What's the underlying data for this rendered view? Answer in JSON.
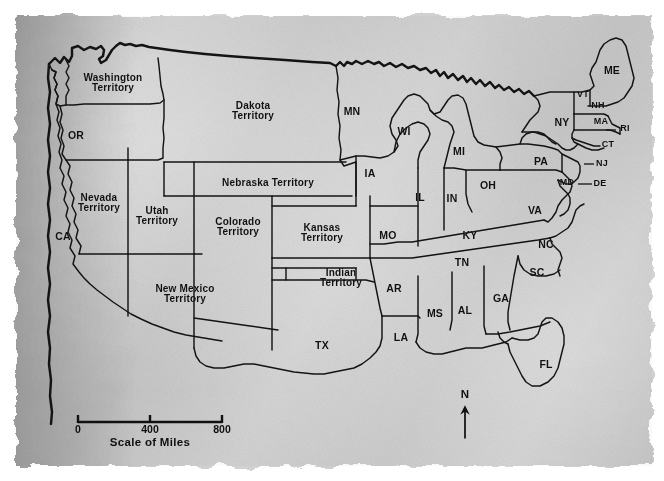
{
  "map": {
    "title": "United States historical map",
    "paper_color": "#c8c8c8",
    "ink_color": "#141414",
    "regions": [
      {
        "name": "washington-territory",
        "label": "Washington\nTerritory",
        "x": 113,
        "y": 83,
        "size": "terr"
      },
      {
        "name": "oregon",
        "label": "OR",
        "x": 76,
        "y": 135,
        "size": "abbr"
      },
      {
        "name": "california",
        "label": "CA",
        "x": 63,
        "y": 236,
        "size": "abbr"
      },
      {
        "name": "nevada-territory",
        "label": "Nevada\nTerritory",
        "x": 99,
        "y": 203,
        "size": "terr"
      },
      {
        "name": "utah-territory",
        "label": "Utah\nTerritory",
        "x": 157,
        "y": 216,
        "size": "terr"
      },
      {
        "name": "colorado-territory",
        "label": "Colorado\nTerritory",
        "x": 238,
        "y": 227,
        "size": "terr"
      },
      {
        "name": "dakota-territory",
        "label": "Dakota\nTerritory",
        "x": 253,
        "y": 111,
        "size": "terr"
      },
      {
        "name": "nebraska-territory",
        "label": "Nebraska Territory",
        "x": 268,
        "y": 183,
        "size": "terr1"
      },
      {
        "name": "kansas-territory",
        "label": "Kansas\nTerritory",
        "x": 322,
        "y": 233,
        "size": "terr"
      },
      {
        "name": "new-mexico-territory",
        "label": "New Mexico\nTerritory",
        "x": 185,
        "y": 294,
        "size": "terr"
      },
      {
        "name": "indian-territory",
        "label": "Indian\nTerritory",
        "x": 341,
        "y": 278,
        "size": "terr"
      },
      {
        "name": "texas",
        "label": "TX",
        "x": 322,
        "y": 345,
        "size": "abbr"
      },
      {
        "name": "minnesota",
        "label": "MN",
        "x": 352,
        "y": 111,
        "size": "abbr"
      },
      {
        "name": "wisconsin",
        "label": "WI",
        "x": 404,
        "y": 131,
        "size": "abbr"
      },
      {
        "name": "iowa",
        "label": "IA",
        "x": 370,
        "y": 173,
        "size": "abbr"
      },
      {
        "name": "missouri",
        "label": "MO",
        "x": 388,
        "y": 235,
        "size": "abbr"
      },
      {
        "name": "arkansas",
        "label": "AR",
        "x": 394,
        "y": 288,
        "size": "abbr"
      },
      {
        "name": "louisiana",
        "label": "LA",
        "x": 401,
        "y": 337,
        "size": "abbr"
      },
      {
        "name": "mississippi",
        "label": "MS",
        "x": 435,
        "y": 313,
        "size": "abbr"
      },
      {
        "name": "alabama",
        "label": "AL",
        "x": 465,
        "y": 310,
        "size": "abbr"
      },
      {
        "name": "georgia",
        "label": "GA",
        "x": 501,
        "y": 298,
        "size": "abbr"
      },
      {
        "name": "florida",
        "label": "FL",
        "x": 546,
        "y": 364,
        "size": "abbr"
      },
      {
        "name": "tennessee",
        "label": "TN",
        "x": 462,
        "y": 262,
        "size": "abbr"
      },
      {
        "name": "kentucky",
        "label": "KY",
        "x": 470,
        "y": 235,
        "size": "abbr"
      },
      {
        "name": "illinois",
        "label": "IL",
        "x": 420,
        "y": 197,
        "size": "abbr"
      },
      {
        "name": "indiana",
        "label": "IN",
        "x": 452,
        "y": 198,
        "size": "abbr"
      },
      {
        "name": "ohio",
        "label": "OH",
        "x": 488,
        "y": 185,
        "size": "abbr"
      },
      {
        "name": "michigan",
        "label": "MI",
        "x": 459,
        "y": 151,
        "size": "abbr"
      },
      {
        "name": "south-carolina",
        "label": "SC",
        "x": 537,
        "y": 272,
        "size": "abbr"
      },
      {
        "name": "north-carolina",
        "label": "NC",
        "x": 546,
        "y": 244,
        "size": "abbr"
      },
      {
        "name": "virginia",
        "label": "VA",
        "x": 535,
        "y": 210,
        "size": "abbr"
      },
      {
        "name": "pennsylvania",
        "label": "PA",
        "x": 541,
        "y": 161,
        "size": "abbr"
      },
      {
        "name": "new-york",
        "label": "NY",
        "x": 562,
        "y": 122,
        "size": "abbr"
      },
      {
        "name": "maine",
        "label": "ME",
        "x": 612,
        "y": 70,
        "size": "abbr"
      },
      {
        "name": "vermont",
        "label": "VT",
        "x": 583,
        "y": 95,
        "size": "tiny"
      },
      {
        "name": "new-hampshire",
        "label": "NH",
        "x": 598,
        "y": 106,
        "size": "tiny"
      },
      {
        "name": "massachusetts",
        "label": "MA",
        "x": 601,
        "y": 122,
        "size": "tiny"
      },
      {
        "name": "rhode-island",
        "label": "RI",
        "x": 625,
        "y": 129,
        "size": "tiny"
      },
      {
        "name": "connecticut",
        "label": "CT",
        "x": 608,
        "y": 145,
        "size": "tiny"
      },
      {
        "name": "new-jersey",
        "label": "NJ",
        "x": 602,
        "y": 164,
        "size": "tiny"
      },
      {
        "name": "maryland",
        "label": "MD",
        "x": 567,
        "y": 183,
        "size": "tiny"
      },
      {
        "name": "delaware",
        "label": "DE",
        "x": 600,
        "y": 184,
        "size": "tiny"
      }
    ]
  },
  "scale": {
    "title": "Scale of Miles",
    "ticks": [
      {
        "label": "0",
        "pos": 0
      },
      {
        "label": "400",
        "pos": 50
      },
      {
        "label": "800",
        "pos": 100
      }
    ]
  },
  "compass": {
    "north_label": "N"
  }
}
